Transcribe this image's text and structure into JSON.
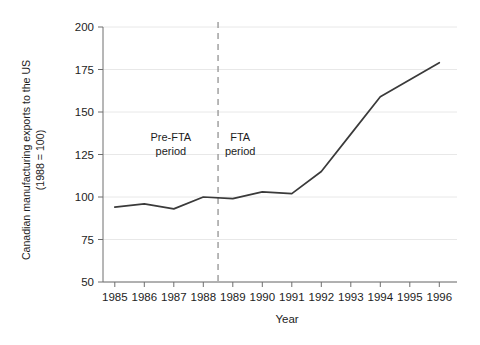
{
  "chart_data": {
    "type": "line",
    "title": "",
    "xlabel": "Year",
    "ylabel": "Canadian manufacturing exports to the US (1988 = 100)",
    "ylabel_line1": "Canadian manufacturing exports to the US",
    "ylabel_line2": "(1988 = 100)",
    "x": [
      1985,
      1986,
      1987,
      1988,
      1989,
      1990,
      1991,
      1992,
      1993,
      1994,
      1995,
      1996
    ],
    "values": [
      94,
      96,
      93,
      100,
      99,
      103,
      102,
      115,
      137,
      159,
      169,
      179
    ],
    "series": [
      {
        "name": "Canadian manufacturing exports to the US",
        "values": [
          94,
          96,
          93,
          100,
          99,
          103,
          102,
          115,
          137,
          159,
          169,
          179
        ]
      }
    ],
    "xtick_labels": [
      "1985",
      "1986",
      "1987",
      "1988",
      "1989",
      "1990",
      "1991",
      "1992",
      "1993",
      "1994",
      "1995",
      "1996"
    ],
    "ytick_labels": [
      "50",
      "75",
      "100",
      "125",
      "150",
      "175",
      "200"
    ],
    "ytick_values": [
      50,
      75,
      100,
      125,
      150,
      175,
      200
    ],
    "ylim": [
      50,
      200
    ],
    "xlim": [
      1984.6,
      1996.6
    ],
    "grid": true,
    "legend": "none",
    "line_color": "#3a3a3a",
    "grid_color": "#e8e8e8",
    "axis_color": "#6e6e6e",
    "annotations": [
      {
        "name": "pre-fta-period",
        "line1": "Pre-FTA",
        "line2": "period",
        "x": 1986.9,
        "y": 133
      },
      {
        "name": "fta-period",
        "line1": "FTA",
        "line2": "period",
        "x": 1989.25,
        "y": 133
      }
    ],
    "vline": {
      "name": "fta-divider",
      "x": 1988.5,
      "style": "dashed",
      "color": "#9a9a9a"
    }
  }
}
